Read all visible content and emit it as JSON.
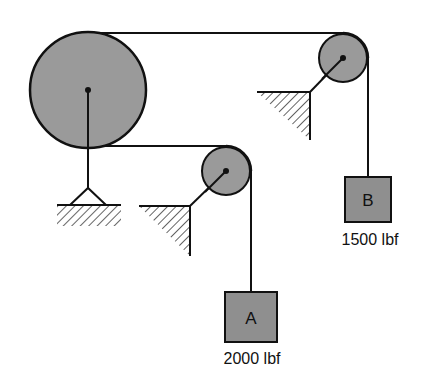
{
  "diagram": {
    "type": "pulley-system",
    "colors": {
      "pulley_fill": "#9a9a9a",
      "block_fill": "#8f8f8f",
      "line": "#111111",
      "background": "#ffffff"
    },
    "pulleys": [
      {
        "id": "large-pulley",
        "support": "pinned ground support"
      },
      {
        "id": "pulley-upper-right",
        "support": "wall bracket"
      },
      {
        "id": "pulley-lower-middle",
        "support": "wall bracket"
      }
    ],
    "blocks": [
      {
        "id": "block-a",
        "label": "A",
        "weight": "2000 lbf"
      },
      {
        "id": "block-b",
        "label": "B",
        "weight": "1500 lbf"
      }
    ]
  }
}
